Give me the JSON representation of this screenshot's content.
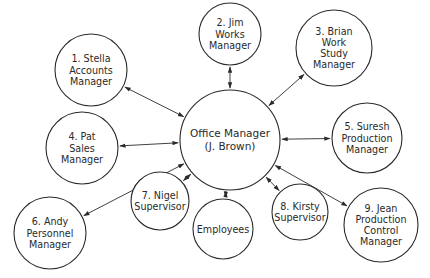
{
  "diagram": {
    "type": "hub-and-spoke",
    "center": {
      "id": "office-manager",
      "lines": [
        "Office Manager",
        "(J. Brown)"
      ]
    },
    "nodes": [
      {
        "id": "stella",
        "number": 1,
        "lines": [
          "1. Stella",
          "Accounts",
          "Manager"
        ]
      },
      {
        "id": "jim",
        "number": 2,
        "lines": [
          "2. Jim",
          "Works",
          "Manager"
        ]
      },
      {
        "id": "brian",
        "number": 3,
        "lines": [
          "3. Brian",
          "Work",
          "Study",
          "Manager"
        ]
      },
      {
        "id": "pat",
        "number": 4,
        "lines": [
          "4. Pat",
          "Sales",
          "Manager"
        ]
      },
      {
        "id": "suresh",
        "number": 5,
        "lines": [
          "5. Suresh",
          "Production",
          "Manager"
        ]
      },
      {
        "id": "andy",
        "number": 6,
        "lines": [
          "6. Andy",
          "Personnel",
          "Manager"
        ]
      },
      {
        "id": "nigel",
        "number": 7,
        "lines": [
          "7. Nigel",
          "Supervisor"
        ]
      },
      {
        "id": "employees",
        "number": null,
        "lines": [
          "Employees"
        ]
      },
      {
        "id": "kirsty",
        "number": 8,
        "lines": [
          "8. Kirsty",
          "Supervisor"
        ]
      },
      {
        "id": "jean",
        "number": 9,
        "lines": [
          "9. Jean",
          "Production",
          "Control",
          "Manager"
        ]
      }
    ],
    "edges": [
      {
        "from": "office-manager",
        "to": "stella",
        "direction": "both"
      },
      {
        "from": "office-manager",
        "to": "jim",
        "direction": "both"
      },
      {
        "from": "office-manager",
        "to": "brian",
        "direction": "both"
      },
      {
        "from": "office-manager",
        "to": "pat",
        "direction": "both"
      },
      {
        "from": "office-manager",
        "to": "suresh",
        "direction": "both"
      },
      {
        "from": "office-manager",
        "to": "andy",
        "direction": "both"
      },
      {
        "from": "office-manager",
        "to": "nigel",
        "direction": "both"
      },
      {
        "from": "office-manager",
        "to": "employees",
        "direction": "both"
      },
      {
        "from": "office-manager",
        "to": "kirsty",
        "direction": "both"
      },
      {
        "from": "office-manager",
        "to": "jean",
        "direction": "both"
      }
    ]
  }
}
